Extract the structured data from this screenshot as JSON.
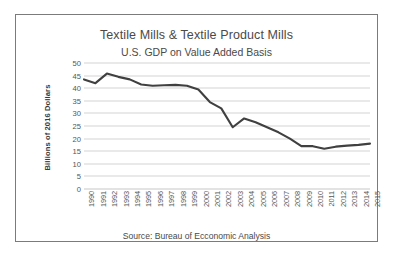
{
  "figure": {
    "background_color": "#ffffff",
    "frame_color": "#7b7b7b"
  },
  "chart_data": {
    "type": "line",
    "title": "Textile Mills & Textile Product Mills",
    "subtitle": "U.S. GDP on Value Added Basis",
    "xlabel": "",
    "ylabel": "Billions of 2016 Dollars",
    "source": "Source: Bureau of Ecconomic Analysis",
    "grid": true,
    "grid_axis": "y",
    "legend": false,
    "legend_position": "none",
    "line_color": "#404040",
    "grid_color": "#d4d4d4",
    "ylim": [
      0,
      50
    ],
    "yticks": [
      50,
      45,
      40,
      35,
      30,
      25,
      20,
      15,
      10,
      5,
      0
    ],
    "categories": [
      "1990",
      "1991",
      "1992",
      "1993",
      "1994",
      "1995",
      "1996",
      "1997",
      "1998",
      "1999",
      "2000",
      "2001",
      "2002",
      "2003",
      "2004",
      "2005",
      "2006",
      "2007",
      "2008",
      "2009",
      "2010",
      "2011",
      "2012",
      "2013",
      "2014",
      "2015"
    ],
    "values": [
      43.5,
      42.0,
      45.8,
      44.5,
      43.5,
      41.5,
      41.0,
      41.2,
      41.3,
      41.0,
      39.5,
      34.5,
      32.0,
      24.5,
      28.0,
      26.5,
      24.5,
      22.5,
      20.0,
      17.0,
      17.0,
      16.0,
      16.8,
      17.2,
      17.5,
      18.0
    ]
  }
}
